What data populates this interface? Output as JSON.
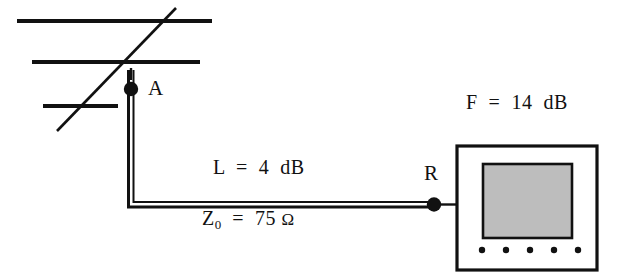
{
  "diagram": {
    "colors": {
      "ink": "#111111",
      "screen_fill": "#bdbdbd",
      "background": "#ffffff"
    },
    "labels": {
      "antenna_terminal": "A",
      "receiver_terminal": "R",
      "noise_figure": "F  =  14  dB",
      "cable_loss": "L  =  4  dB",
      "impedance_symbol": "Z",
      "impedance_subscript": "0",
      "impedance_value": "  =  75 ",
      "impedance_unit": "Ω"
    },
    "parts": {
      "antenna": "yagi-antenna",
      "feedline": "twin-lead-transmission-line",
      "receiver": "receiver-unit",
      "screen": "receiver-display-screen",
      "controls": "receiver-control-dots"
    }
  }
}
